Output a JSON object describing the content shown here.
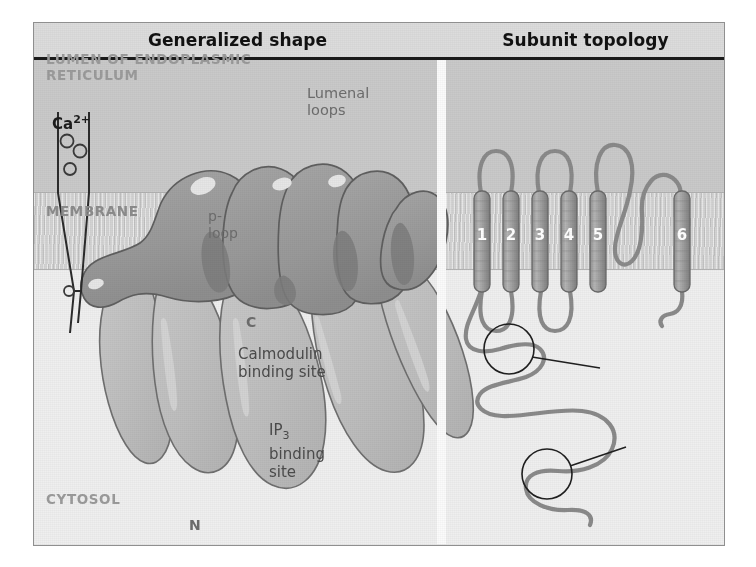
{
  "figure": {
    "panels": [
      {
        "id": "left",
        "title": "Generalized shape"
      },
      {
        "id": "right",
        "title": "Subunit topology"
      }
    ],
    "compartments": {
      "lumen": "LUMEN OF ENDOPLASMIC\nRETICULUM",
      "membrane": "MEMBRANE",
      "cytosol": "CYTOSOL"
    },
    "left_panel": {
      "ion_label": "Ca",
      "ion_charge": "2+",
      "ion_count": 4
    },
    "right_panel": {
      "lumenal_loops_label": "Lumenal\nloops",
      "ploop_label": "p-\nloop",
      "calmodulin_label": "Calmodulin\nbinding site",
      "ip3_label_main": "IP",
      "ip3_label_sub": "3",
      "ip3_label_rest": "binding\nsite",
      "c_terminus": "C",
      "n_terminus": "N",
      "helices": [
        {
          "number": "1"
        },
        {
          "number": "2"
        },
        {
          "number": "3"
        },
        {
          "number": "4"
        },
        {
          "number": "5"
        },
        {
          "number": "6"
        }
      ]
    },
    "colors": {
      "lumen_bg": "#c9c9c9",
      "membrane_bg": "#d3d3d3",
      "cytosol_bg": "#efefef",
      "header_bg": "#dcdcdc",
      "protein_dark": "#9d9d9d",
      "protein_light": "#c0c0c0",
      "outline": "#6f6f6f",
      "text_gray": "#9b9b9b",
      "title_text": "#111111"
    }
  }
}
